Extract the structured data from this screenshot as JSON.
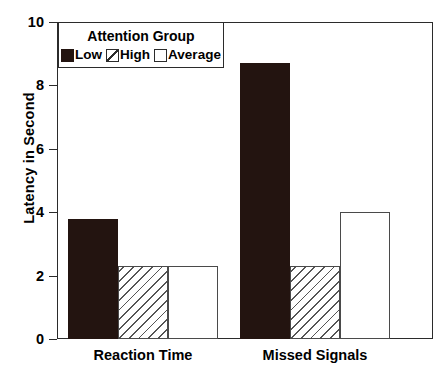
{
  "chart_data": {
    "type": "bar",
    "title": "",
    "xlabel": "",
    "ylabel": "Latency in Second",
    "categories": [
      "Reaction Time",
      "Missed Signals"
    ],
    "series": [
      {
        "name": "Low",
        "values": [
          3.8,
          8.7
        ],
        "pattern": "solid-black",
        "color": "#231410"
      },
      {
        "name": "High",
        "values": [
          2.3,
          2.3
        ],
        "pattern": "diagonal-hatch",
        "color": "#ffffff"
      },
      {
        "name": "Average",
        "values": [
          2.3,
          4.0
        ],
        "pattern": "empty-white",
        "color": "#ffffff"
      }
    ],
    "ylim": [
      0,
      10
    ],
    "yticks": [
      0,
      2,
      4,
      6,
      8,
      10
    ],
    "ytick_labels": [
      "0",
      "2",
      "4",
      "6",
      "8",
      "10"
    ],
    "grid": false,
    "legend": {
      "title": "Attention Group",
      "position": "top-left-inside",
      "entries": [
        {
          "label": "Low",
          "swatch": "solid-black-swatch"
        },
        {
          "label": "High",
          "swatch": "diagonal-hatch-swatch"
        },
        {
          "label": "Average",
          "swatch": "empty-white-swatch"
        }
      ]
    }
  }
}
